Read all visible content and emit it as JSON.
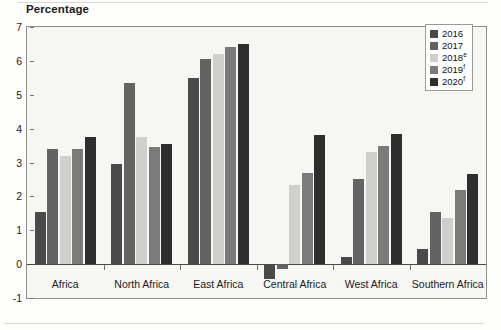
{
  "chart_data": {
    "type": "bar",
    "title": "",
    "ylabel": "Percentage",
    "xlabel": "",
    "ylim": [
      -1,
      7
    ],
    "yticks": [
      -1,
      0,
      1,
      2,
      3,
      4,
      5,
      6,
      7
    ],
    "ytick_labels": [
      "-1",
      "0",
      "1",
      "2",
      "3",
      "4",
      "5",
      "6",
      "7"
    ],
    "grid": false,
    "legend_position": "top-right",
    "categories": [
      "Africa",
      "North Africa",
      "East Africa",
      "Central Africa",
      "West Africa",
      "Southern Africa"
    ],
    "series": [
      {
        "name": "2016",
        "color": "#4a4a4a",
        "values": [
          1.55,
          2.95,
          5.5,
          -0.45,
          0.2,
          0.45
        ]
      },
      {
        "name": "2017",
        "color": "#636363",
        "values": [
          3.4,
          5.35,
          6.05,
          -0.15,
          2.5,
          1.55
        ]
      },
      {
        "name": "2018",
        "suffix": "e",
        "color": "#cfcfcc",
        "values": [
          3.2,
          3.75,
          6.2,
          2.35,
          3.3,
          1.35
        ]
      },
      {
        "name": "2019",
        "suffix": "f",
        "color": "#7a7a7a",
        "values": [
          3.4,
          3.45,
          6.4,
          2.7,
          3.5,
          2.2
        ]
      },
      {
        "name": "2020",
        "suffix": "f",
        "color": "#2e2e2e",
        "values": [
          3.75,
          3.55,
          6.5,
          3.8,
          3.85,
          2.65
        ]
      }
    ],
    "legend_entries": [
      {
        "label": "2016",
        "suffix": "",
        "color": "#4a4a4a"
      },
      {
        "label": "2017",
        "suffix": "",
        "color": "#636363"
      },
      {
        "label": "2018",
        "suffix": "e",
        "color": "#cfcfcc"
      },
      {
        "label": "2019",
        "suffix": "f",
        "color": "#7a7a7a"
      },
      {
        "label": "2020",
        "suffix": "f",
        "color": "#2e2e2e"
      }
    ]
  }
}
